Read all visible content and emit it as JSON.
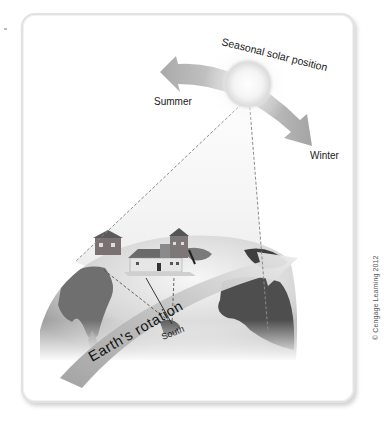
{
  "diagram": {
    "title": "Seasonal solar position",
    "labels": {
      "arc": "Seasonal solar position",
      "summer": "Summer",
      "winter": "Winter",
      "rotation": "Earth's rotation",
      "south": "South"
    },
    "credit": "© Cengage Learning 2012",
    "elements": [
      {
        "name": "sun",
        "description": "glowing sphere at top center"
      },
      {
        "name": "seasonal-arrow",
        "description": "grey double-headed curved arrow, left end Summer, right end Winter"
      },
      {
        "name": "earth-globe",
        "description": "grey-shaded globe with continents at bottom"
      },
      {
        "name": "houses",
        "description": "two small houses on globe surface"
      },
      {
        "name": "rotation-arrow",
        "description": "broad curved grey arrow across globe labeled Earth's rotation"
      },
      {
        "name": "sun-rays",
        "description": "dashed lines from sun down to globe"
      },
      {
        "name": "south-lines",
        "description": "solid and dashed lines from house converging at South"
      }
    ],
    "colors": {
      "arrow": "#b5b5b5",
      "globe_dark": "#5a5a5a",
      "globe_light": "#e8e8e8",
      "text": "#1a1a1a",
      "card_border": "#e2e2e2"
    }
  }
}
